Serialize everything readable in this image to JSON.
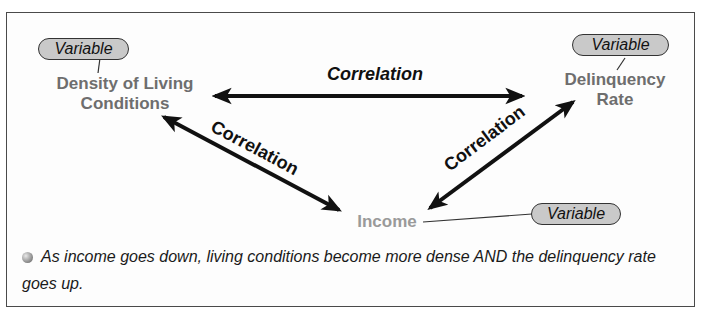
{
  "diagram": {
    "nodes": [
      {
        "id": "density",
        "label_line1": "Density of Living",
        "label_line2": "Conditions",
        "tag": "Variable"
      },
      {
        "id": "delinquency",
        "label_line1": "Delinquency",
        "label_line2": "Rate",
        "tag": "Variable"
      },
      {
        "id": "income",
        "label": "Income",
        "tag": "Variable"
      }
    ],
    "edges": [
      {
        "from": "density",
        "to": "delinquency",
        "label": "Correlation"
      },
      {
        "from": "density",
        "to": "income",
        "label": "Correlation"
      },
      {
        "from": "income",
        "to": "delinquency",
        "label": "Correlation"
      }
    ],
    "colors": {
      "node_text": "#6e6e6e",
      "income_text": "#9a9a9a",
      "pill_fill": "#c9c9c9",
      "arrow": "#111111"
    }
  },
  "note": {
    "text": "As income goes down, living conditions become more dense AND the delinquency rate goes up."
  }
}
